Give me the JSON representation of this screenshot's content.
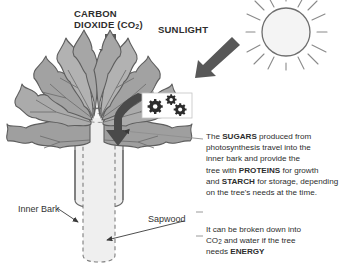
{
  "diagram": {
    "background_color": "#ffffff",
    "width": 357,
    "height": 276
  },
  "labels": {
    "carbon_dioxide_line1": "CARBON",
    "carbon_dioxide_line2": "DIOXIDE (CO",
    "carbon_dioxide_sub": "2",
    "carbon_dioxide_close": ")",
    "sunlight": "SUNLIGHT",
    "inner_bark": "Inner Bark",
    "sapwood": "Sapwood"
  },
  "callouts": {
    "sugars_text": {
      "l1_a": "The ",
      "l1_b": "SUGARS",
      "l1_c": " produced from",
      "l2": "photosynthesis travel into the",
      "l3": "inner bark and provide the",
      "l4_a": "tree with ",
      "l4_b": "PROTEINS",
      "l4_c": " for growth",
      "l5_a": "and ",
      "l5_b": "STARCH",
      "l5_c": " for storage, depending",
      "l6": "on the tree's needs at the time."
    },
    "energy_text": {
      "l1": "It can be broken down into",
      "l2_a": "CO",
      "l2_sub": "2",
      "l2_b": " and water if the tree",
      "l3_a": "needs ",
      "l3_b": "ENERGY"
    }
  },
  "icons": {
    "sun": "sun-icon",
    "gears": "gears-icon",
    "co2_arrow": "down-arrow-icon",
    "sunlight_arrow": "diagonal-arrow-icon",
    "transport_arrow": "curved-down-arrow-icon",
    "inner_bark_pointer": "pointer-arrow-icon",
    "sapwood_pointer": "pointer-arrow-icon",
    "sugars_pointer": "leader-line-icon",
    "energy_pointer": "leader-line-icon"
  },
  "colors": {
    "leaf_fill": "#a6a6a6",
    "leaf_fill_dark": "#8d8d8d",
    "leaf_outline": "#5a5a5a",
    "trunk_fill": "#f0f0f0",
    "trunk_outline": "#6e6e6e",
    "arrow_fill": "#5a5a5a",
    "sun_fill": "#f2f2f2",
    "sun_outline": "#7a7a7a",
    "text": "#2d2d2d",
    "gearbox_fill": "#ffffff"
  }
}
